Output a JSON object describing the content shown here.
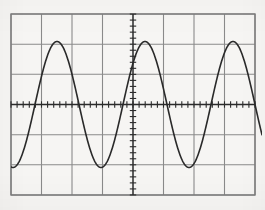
{
  "figure": {
    "kind": "oscilloscope-graticule-plot",
    "width": 265,
    "height": 210,
    "background_color": "#f6f5f3",
    "grid_color": "#8a8a8a",
    "axis_color": "#2b2b2b",
    "trace_color": "#2a2a2a",
    "border_color": "#7d7d7d"
  },
  "graticule": {
    "left": 11,
    "top": 14,
    "right": 255,
    "bottom": 195,
    "columns": 8,
    "rows": 6,
    "division_width": 30.5,
    "division_height": 30.17,
    "vertical_line_x": [
      11,
      41.5,
      72,
      102.5,
      133,
      163.5,
      194,
      224.5,
      255
    ],
    "horizontal_line_y": [
      14,
      44.2,
      74.3,
      104.5,
      134.7,
      164.8,
      195
    ],
    "grid_enabled": true,
    "border_enabled": true
  },
  "axes": {
    "x_axis": {
      "y": 104.5,
      "from_x": 11,
      "to_x": 255,
      "tick_spacing": 6.1,
      "tick_half_length": 3.2,
      "ticks_per_division": 5
    },
    "y_axis": {
      "x": 133,
      "from_y": 14,
      "to_y": 195,
      "tick_spacing": 6.03,
      "tick_half_length": 3.2,
      "ticks_per_division": 5
    }
  },
  "chart_data": {
    "type": "line",
    "title": "",
    "subtitle": "",
    "xlabel": "",
    "ylabel": "",
    "legend": [],
    "legend_position": "none",
    "grid": true,
    "xlim": [
      11,
      262
    ],
    "ylim": [
      195,
      14
    ],
    "x_axis_pixel": 104.5,
    "y_axis_pixel": 133,
    "waveform": {
      "shape": "sine",
      "amplitude_px": 63,
      "amplitude_divisions": 2.09,
      "period_px": 88,
      "period_divisions": 2.89,
      "center_y_px": 104.5,
      "peak_y_px": 41.5,
      "trough_y_px": 167.5,
      "phase_peaks_x_px": [
        57,
        145,
        233
      ],
      "phase_troughs_x_px": [
        13,
        101,
        189
      ],
      "clip_left_x_px": 11,
      "clip_right_x_px": 262,
      "stroke_width": 1.6
    },
    "series": [
      {
        "name": "sine-trace",
        "color": "#2a2a2a",
        "x": [
          11,
          13,
          17,
          22,
          27,
          32,
          35,
          40,
          45,
          50,
          57,
          62,
          68,
          74,
          79,
          85,
          90,
          96,
          101,
          106,
          112,
          118,
          123,
          128,
          133,
          139,
          145,
          150,
          156,
          162,
          167,
          173,
          178,
          184,
          189,
          194,
          200,
          206,
          211,
          216,
          222,
          228,
          233,
          239,
          244,
          250,
          255,
          262
        ],
        "y": [
          165.5,
          167.5,
          165.0,
          156.5,
          143.0,
          126.0,
          115.0,
          97.5,
          79.0,
          62.5,
          41.5,
          44.0,
          54.5,
          71.0,
          85.5,
          104.0,
          119.5,
          140.0,
          152.0,
          161.5,
          167.0,
          165.0,
          156.5,
          143.0,
          126.0,
          97.5,
          41.5,
          44.0,
          54.5,
          71.0,
          85.5,
          104.0,
          119.5,
          140.0,
          152.0,
          161.5,
          167.0,
          165.0,
          156.5,
          143.0,
          126.0,
          97.5,
          41.5,
          44.0,
          54.5,
          71.0,
          85.5,
          119.5
        ]
      }
    ]
  }
}
